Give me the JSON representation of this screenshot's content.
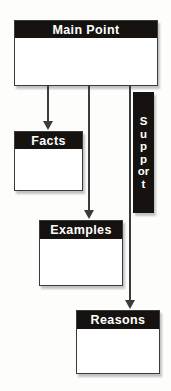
{
  "diagram": {
    "colors": {
      "header_fill": "#15120f",
      "header_text": "#ffffff",
      "body_fill": "#ffffff",
      "border": "#3a3a3a",
      "connector": "#3b3b3b",
      "background": "#fdfdfc"
    },
    "nodes": [
      {
        "id": "main",
        "label": "Main Point",
        "body_text": ""
      },
      {
        "id": "facts",
        "label": "Facts",
        "body_text": ""
      },
      {
        "id": "examples",
        "label": "Examples",
        "body_text": ""
      },
      {
        "id": "reasons",
        "label": "Reasons",
        "body_text": ""
      }
    ],
    "support_bar": {
      "label": "Support",
      "orientation": "vertical",
      "letters": "S\nu\np\np\no\nr\nt"
    },
    "connectors": [
      {
        "id": "main-to-facts",
        "from": "Main Point",
        "to": "Facts",
        "style": "arrow-down"
      },
      {
        "id": "main-to-examples",
        "from": "Main Point",
        "to": "Examples",
        "style": "arrow-down"
      },
      {
        "id": "main-to-reasons",
        "from": "Main Point",
        "to": "Reasons",
        "style": "arrow-down"
      }
    ]
  }
}
